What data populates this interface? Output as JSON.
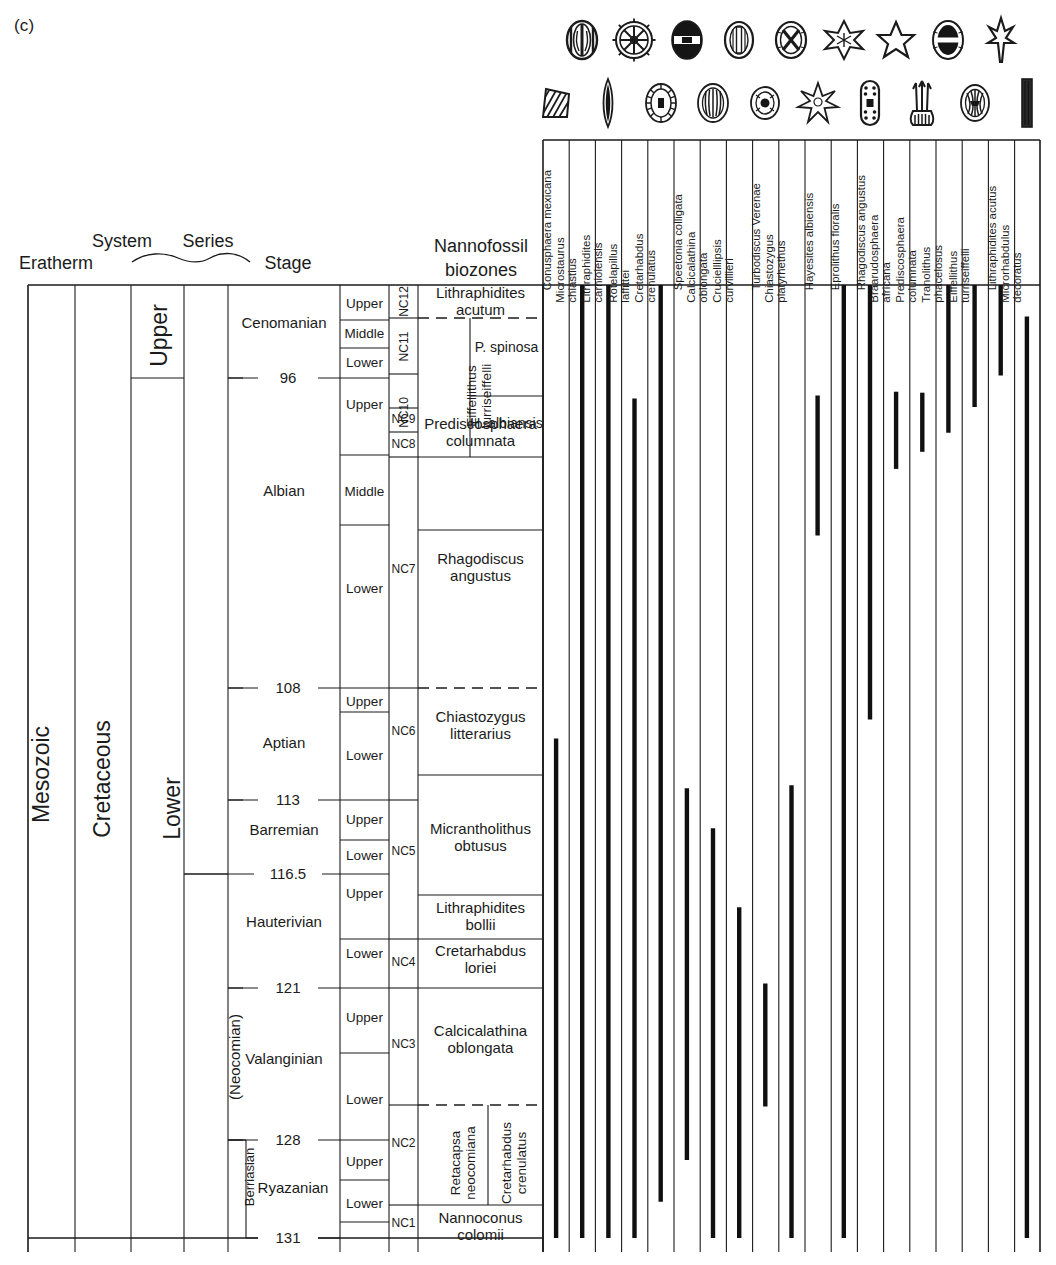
{
  "panel": {
    "label": "(c)"
  },
  "headers": {
    "eratherm": "Eratherm",
    "system": "System",
    "series": "Series",
    "stage": "Stage",
    "nannofossil": "Nannofossil",
    "biozones": "biozones"
  },
  "eratherm_col": [
    {
      "label": "Mesozoic"
    }
  ],
  "system_col": [
    {
      "label": "Cretaceous"
    }
  ],
  "series_col": [
    {
      "label": "Upper"
    },
    {
      "label": "Lower"
    }
  ],
  "subseries_col": [
    {
      "label": "(Neocomian)"
    }
  ],
  "substage_col": [
    {
      "label": "Berriasian"
    }
  ],
  "stage_col": [
    {
      "label": "Cenomanian"
    },
    {
      "label": "Albian"
    },
    {
      "label": "Aptian"
    },
    {
      "label": "Barremian"
    },
    {
      "label": "Hauterivian"
    },
    {
      "label": "Valanginian"
    },
    {
      "label": "Ryazanian"
    }
  ],
  "age_ticks": [
    {
      "value": "96"
    },
    {
      "value": "108"
    },
    {
      "value": "113"
    },
    {
      "value": "116.5"
    },
    {
      "value": "121"
    },
    {
      "value": "128"
    },
    {
      "value": "131"
    }
  ],
  "substage_col_items": [
    {
      "label": "Upper"
    },
    {
      "label": "Middle"
    },
    {
      "label": "Lower"
    },
    {
      "label": "Upper"
    },
    {
      "label": "Middle"
    },
    {
      "label": "Lower"
    },
    {
      "label": "Upper"
    },
    {
      "label": "Lower"
    },
    {
      "label": "Upper"
    },
    {
      "label": "Lower"
    },
    {
      "label": "Upper"
    },
    {
      "label": "Lower"
    },
    {
      "label": "Upper"
    },
    {
      "label": "Lower"
    },
    {
      "label": "Upper"
    },
    {
      "label": "Lower"
    }
  ],
  "nc_zones": [
    {
      "label": "NC12"
    },
    {
      "label": "NC11"
    },
    {
      "label": "NC10"
    },
    {
      "label": "NC9"
    },
    {
      "label": "NC8"
    },
    {
      "label": "NC7"
    },
    {
      "label": "NC6"
    },
    {
      "label": "NC5"
    },
    {
      "label": "NC4"
    },
    {
      "label": "NC3"
    },
    {
      "label": "NC2"
    },
    {
      "label": "NC1"
    }
  ],
  "biozones": [
    {
      "label": "Lithraphidites\nacutum"
    },
    {
      "label": "Eiffellithus\nturriseiffelli"
    },
    {
      "label": "P. spinosa"
    },
    {
      "label": "H. albiansis"
    },
    {
      "label": "Prediscosphaera\ncolumnata"
    },
    {
      "label": "Rhagodiscus\nangustus"
    },
    {
      "label": "Chiastozygus\nlitterarius"
    },
    {
      "label": "Micrantholithus\nobtusus"
    },
    {
      "label": "Lithraphidites\nbollii"
    },
    {
      "label": "Cretarhabdus\nloriei"
    },
    {
      "label": "Calcicalathina\noblongata"
    },
    {
      "label": "Retacapsa\nneocomiana"
    },
    {
      "label": "Cretarhabdus\ncrenulatus"
    },
    {
      "label": "Nannoconus\ncolomii"
    }
  ],
  "chart_data": {
    "type": "range",
    "xlabel": "Nannofossil taxa",
    "ylabel": "Age (Ma)",
    "ylim": [
      131,
      93
    ],
    "axis_note": "Vertical axis is stratigraphic (older downward); bars are taxon stratigraphic ranges.",
    "taxa": [
      {
        "name": "Conusphaera mexicana",
        "icon": "coccolith-elliptical-bars",
        "top_label": "Aptian/NC6",
        "bottom_label": "base",
        "top_frac": 0.476,
        "bottom_frac": 1.0
      },
      {
        "name": "Microstaurus chiastius",
        "icon": "coccolith-wheel-spokes",
        "top_label": "top of chart",
        "bottom_label": "base",
        "top_frac": 0.0,
        "bottom_frac": 1.0
      },
      {
        "name": "Lithraphidites carniolensis",
        "icon": "nannolith-lanceolate",
        "top_label": "top of chart",
        "bottom_label": "base",
        "top_frac": 0.0,
        "bottom_frac": 1.0
      },
      {
        "name": "Rotelapillus laffittei",
        "icon": "coccolith-dark-banded",
        "top_label": "Upper Albian/NC9",
        "bottom_label": "base",
        "top_frac": 0.119,
        "bottom_frac": 1.0
      },
      {
        "name": "Cretarhabdus crenulatus",
        "icon": "coccolith-ringed-centre",
        "top_label": "top of chart",
        "bottom_label": "Ryazanian",
        "top_frac": 0.0,
        "bottom_frac": 0.962
      },
      {
        "name": "Speetonia colligata",
        "icon": "coccolith-oval-rim",
        "top_label": "Barremian/NC5",
        "bottom_label": "Ryazanian",
        "top_frac": 0.528,
        "bottom_frac": 0.918
      },
      {
        "name": "Calcicalathina oblongata",
        "icon": "coccolith-cross-centre",
        "top_label": "Barremian/NC5",
        "bottom_label": "base",
        "top_frac": 0.57,
        "bottom_frac": 1.0
      },
      {
        "name": "Crucielllipsis curvillieri",
        "icon": "nannolith-six-rayed-star",
        "top_label": "Hauterivian/NC4",
        "bottom_label": "base",
        "top_frac": 0.653,
        "bottom_frac": 1.0
      },
      {
        "name": "Turbodiscus Verenae",
        "icon": "coccolith-spotted-oval",
        "top_label": "Valanginian/NC3",
        "bottom_label": "Lower Valanginian",
        "top_frac": 0.733,
        "bottom_frac": 0.862
      },
      {
        "name": "Chiastozygus platyrhethus",
        "icon": "nannolith-rosette",
        "top_label": "Aptian/NC6",
        "bottom_label": "base",
        "top_frac": 0.525,
        "bottom_frac": 1.0
      },
      {
        "name": "Hayesites albiensis",
        "icon": "nannolith-five-rayed-star",
        "top_label": "Upper Albian/NC9",
        "bottom_label": "Albian/NC7",
        "top_frac": 0.116,
        "bottom_frac": 0.263
      },
      {
        "name": "Eprolithus floralis",
        "icon": "coccolith-dark-oval",
        "top_label": "top of chart",
        "bottom_label": "base",
        "top_frac": 0.0,
        "bottom_frac": 1.0
      },
      {
        "name": "Rhagodiscus angustus",
        "icon": "nannolith-spiked-rod",
        "top_label": "top of chart",
        "bottom_label": "Aptian/NC6",
        "top_frac": 0.0,
        "bottom_frac": 0.456
      },
      {
        "name": "Braarudosphaera africana",
        "icon": "nannolith-seven-rayed-star",
        "top_label": "Upper Albian/NC9",
        "bottom_label": "Albian/NC7",
        "top_frac": 0.112,
        "bottom_frac": 0.193
      },
      {
        "name": "Prediscosphaera columnata",
        "icon": "coccolith-dotted-rod",
        "top_label": "Upper Albian/NC9",
        "bottom_label": "Albian/NC8",
        "top_frac": 0.113,
        "bottom_frac": 0.175
      },
      {
        "name": "Tranolithus phacelosus",
        "icon": "nannolith-branched",
        "top_label": "top of chart",
        "bottom_label": "Albian/NC9",
        "top_frac": 0.0,
        "bottom_frac": 0.155
      },
      {
        "name": "Eiffellithus turriseiffelli",
        "icon": "coccolith-ribbed-oval",
        "top_label": "top of chart",
        "bottom_label": "Albian/NC9",
        "top_frac": 0.0,
        "bottom_frac": 0.128
      },
      {
        "name": "Lithraphidites acutus",
        "icon": "nannolith-solid-rod",
        "top_label": "top of chart",
        "bottom_label": "Lower Cenomanian",
        "top_frac": 0.0,
        "bottom_frac": 0.095
      },
      {
        "name": "Microrhabdulus decoratus",
        "icon": "nannolith-slim-rod",
        "top_label": "Cenomanian/NC12",
        "bottom_label": "base",
        "top_frac": 0.033,
        "bottom_frac": 1.0
      }
    ]
  }
}
